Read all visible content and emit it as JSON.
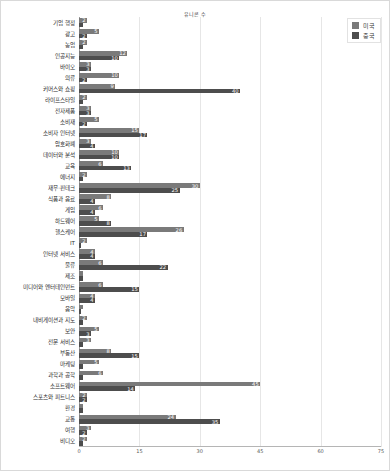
{
  "chart_data": {
    "type": "bar",
    "orientation": "horizontal",
    "title": "유니콘 수",
    "xlabel": "",
    "ylabel": "",
    "xlim": [
      0,
      75
    ],
    "xticks": [
      0,
      15,
      30,
      45,
      60,
      75
    ],
    "grid": true,
    "legend_position": "top-right",
    "stacked": false,
    "grouped": true,
    "categories": [
      "기업 행정",
      "광고",
      "농업",
      "인공지능",
      "바이오",
      "의류",
      "커머스와 쇼핑",
      "라이프스타일",
      "전자제품",
      "소비재",
      "소비자 인터넷",
      "암호화폐",
      "데이터와 분석",
      "교육",
      "에너지",
      "재무·핀테크",
      "식품과 음료",
      "게임",
      "하드웨어",
      "헬스케어",
      "IT",
      "인터넷 서비스",
      "물류",
      "제조",
      "미디어와 엔터테인먼트",
      "모바일",
      "음악",
      "내비게이션과 지도",
      "보안",
      "전문 서비스",
      "부동산",
      "마케팅",
      "과학과 공학",
      "소프트웨어",
      "스포츠와 피트니스",
      "환경",
      "교통",
      "여행",
      "비디오"
    ],
    "series": [
      {
        "name": "미국",
        "color": "#7a7a7a",
        "values": [
          2,
          5,
          2,
          12,
          3,
          10,
          9,
          2,
          3,
          5,
          15,
          3,
          10,
          6,
          2,
          30,
          8,
          6,
          5,
          26,
          2,
          4,
          6,
          1,
          6,
          4,
          1,
          2,
          5,
          3,
          8,
          5,
          6,
          45,
          2,
          1,
          24,
          3,
          2
        ]
      },
      {
        "name": "중국",
        "color": "#4d4d4d",
        "values": [
          1,
          2,
          1,
          10,
          3,
          2,
          40,
          1,
          3,
          2,
          17,
          4,
          10,
          13,
          1,
          25,
          4,
          4,
          8,
          17,
          0,
          4,
          22,
          1,
          15,
          4,
          0,
          1,
          3,
          1,
          15,
          1,
          1,
          14,
          2,
          1,
          35,
          2,
          1
        ]
      }
    ]
  },
  "legend": {
    "entries": [
      {
        "label": "미국",
        "color": "#7a7a7a"
      },
      {
        "label": "중국",
        "color": "#4d4d4d"
      }
    ]
  }
}
